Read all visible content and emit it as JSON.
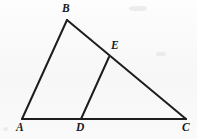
{
  "figure": {
    "type": "geometry-diagram",
    "background_color": "#fbfbfb",
    "stroke_color": "#1d1d1d",
    "stroke_width": 2,
    "canvas": {
      "width": 197,
      "height": 139
    },
    "points": [
      {
        "id": "A",
        "label": "A",
        "x": 22,
        "y": 119,
        "label_x": 16,
        "label_y": 122
      },
      {
        "id": "B",
        "label": "B",
        "x": 67,
        "y": 20,
        "label_x": 62,
        "label_y": 3
      },
      {
        "id": "C",
        "label": "C",
        "x": 186,
        "y": 119,
        "label_x": 182,
        "label_y": 122
      },
      {
        "id": "D",
        "label": "D",
        "x": 81,
        "y": 119,
        "label_x": 76,
        "label_y": 122
      },
      {
        "id": "E",
        "label": "E",
        "x": 109,
        "y": 57,
        "label_x": 111,
        "label_y": 40
      }
    ],
    "segments": [
      {
        "id": "AB",
        "from": "A",
        "to": "B"
      },
      {
        "id": "BC",
        "from": "B",
        "to": "C"
      },
      {
        "id": "AC",
        "from": "A",
        "to": "C"
      },
      {
        "id": "DE",
        "from": "D",
        "to": "E"
      }
    ]
  }
}
